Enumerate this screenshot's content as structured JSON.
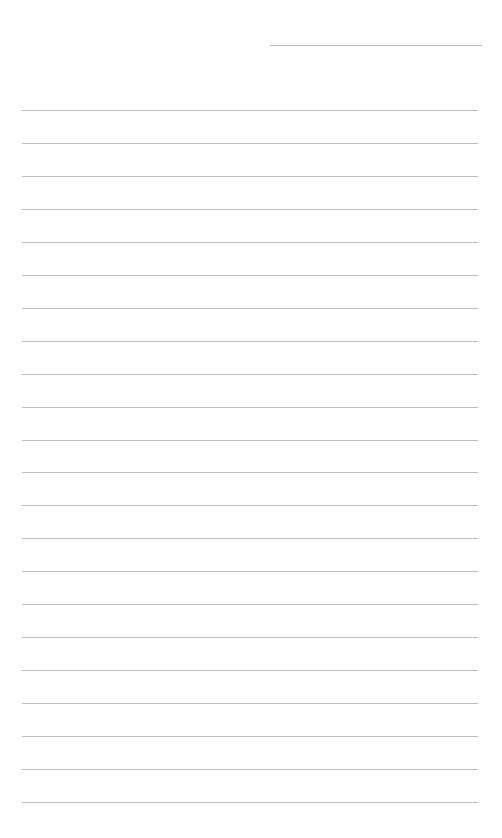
{
  "page": {
    "type": "lined-paper",
    "background_color": "#ffffff",
    "line_color": "#bdbdbd",
    "header_line": {
      "present": true
    },
    "ruled_line_count": 22,
    "text": ""
  }
}
